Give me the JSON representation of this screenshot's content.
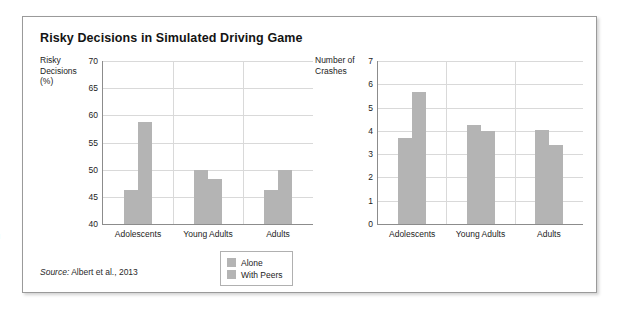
{
  "page": {
    "edge_glyph": ")"
  },
  "figure": {
    "title": "Risky Decisions in Simulated Driving Game",
    "source_label": "Source:",
    "source_text": " Albert et al., 2013",
    "bar_color": "#b4b4b4",
    "axis_color": "#8c8c8c",
    "grid_color": "#d9d9d9"
  },
  "legend": {
    "items": [
      {
        "label": "Alone",
        "color": "#b4b4b4"
      },
      {
        "label": "With Peers",
        "color": "#b4b4b4"
      }
    ]
  },
  "chart_data": [
    {
      "id": "risky-decisions",
      "type": "bar",
      "title": "",
      "ylabel": "Risky\nDecisions\n(%)",
      "xlabel": "",
      "ylim": [
        40,
        70
      ],
      "yticks": [
        40,
        45,
        50,
        55,
        60,
        65,
        70
      ],
      "ytick_labels": [
        "40",
        "45",
        "50",
        "55",
        "60",
        "65",
        "70"
      ],
      "grid": true,
      "categories": [
        "Adolescents",
        "Young Adults",
        "Adults"
      ],
      "series": [
        {
          "name": "Alone",
          "values": [
            46.2,
            50.0,
            46.2
          ]
        },
        {
          "name": "With Peers",
          "values": [
            58.8,
            48.3,
            50.0
          ]
        }
      ],
      "legend_position": "bottom-center"
    },
    {
      "id": "number-of-crashes",
      "type": "bar",
      "title": "",
      "ylabel": "Number of\nCrashes",
      "xlabel": "",
      "ylim": [
        0,
        7
      ],
      "yticks": [
        0,
        1,
        2,
        3,
        4,
        5,
        6,
        7
      ],
      "ytick_labels": [
        "0",
        "1",
        "2",
        "3",
        "4",
        "5",
        "6",
        "7"
      ],
      "grid": true,
      "categories": [
        "Adolescents",
        "Young Adults",
        "Adults"
      ],
      "series": [
        {
          "name": "Alone",
          "values": [
            3.7,
            4.25,
            4.05
          ]
        },
        {
          "name": "With Peers",
          "values": [
            5.65,
            4.0,
            3.4
          ]
        }
      ],
      "legend_position": "bottom-center"
    }
  ]
}
